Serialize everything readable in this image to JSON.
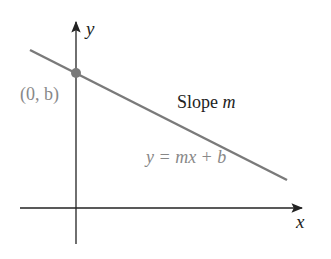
{
  "diagram": {
    "axes": {
      "x_label": "x",
      "y_label": "y"
    },
    "point_label": "(0, b)",
    "slope_label_text": "Slope ",
    "slope_label_var": "m",
    "equation_label": "y = mx + b",
    "colors": {
      "axis": "#222222",
      "line": "#7a7a7a",
      "point": "#7a7a7a",
      "gray_text": "#888888",
      "dark_text": "#222222"
    }
  }
}
